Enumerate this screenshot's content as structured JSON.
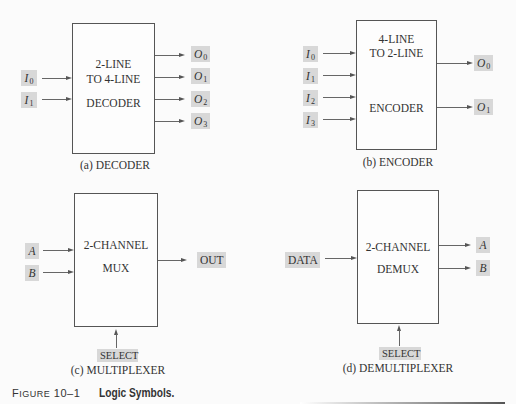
{
  "figure": {
    "number": "Figure 10–1",
    "number_prefix": "F",
    "number_rest": "IGURE",
    "number_digits": "10–1",
    "title": "Logic Symbols."
  },
  "decoder": {
    "caption": "(a)  DECODER",
    "line1": "2-LINE",
    "line2": "TO 4-LINE",
    "line3": "DECODER",
    "inputs": [
      {
        "base": "I",
        "sub": "0"
      },
      {
        "base": "I",
        "sub": "1"
      }
    ],
    "outputs": [
      {
        "base": "O",
        "sub": "0"
      },
      {
        "base": "O",
        "sub": "1"
      },
      {
        "base": "O",
        "sub": "2"
      },
      {
        "base": "O",
        "sub": "3"
      }
    ]
  },
  "encoder": {
    "caption": "(b)  ENCODER",
    "line1": "4-LINE",
    "line2": "TO 2-LINE",
    "line3": "ENCODER",
    "inputs": [
      {
        "base": "I",
        "sub": "0"
      },
      {
        "base": "I",
        "sub": "1"
      },
      {
        "base": "I",
        "sub": "2"
      },
      {
        "base": "I",
        "sub": "3"
      }
    ],
    "outputs": [
      {
        "base": "O",
        "sub": "0"
      },
      {
        "base": "O",
        "sub": "1"
      }
    ]
  },
  "mux": {
    "caption": "(c)  MULTIPLEXER",
    "line1": "2-CHANNEL",
    "line2": "MUX",
    "inputs": [
      "A",
      "B"
    ],
    "output": "OUT",
    "select": "SELECT"
  },
  "demux": {
    "caption": "(d)  DEMULTIPLEXER",
    "line1": "2-CHANNEL",
    "line2": "DEMUX",
    "input": "DATA",
    "outputs": [
      "A",
      "B"
    ],
    "select": "SELECT"
  },
  "colors": {
    "background": "#fbfbfb",
    "label_shade": "#d8d8d8",
    "line": "#555555"
  }
}
